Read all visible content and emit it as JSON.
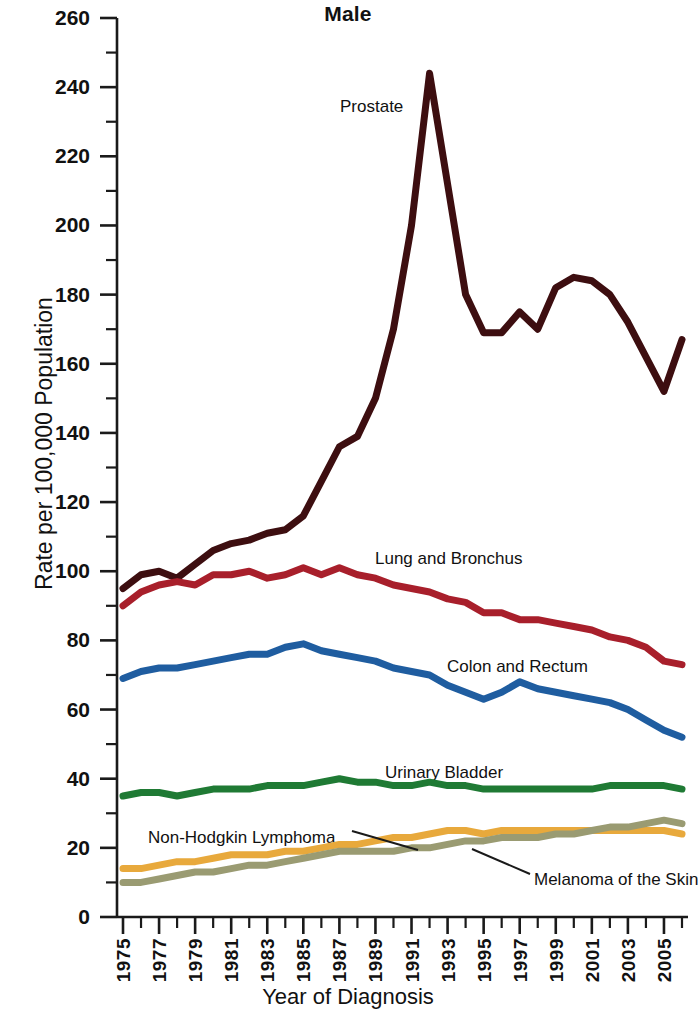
{
  "chart_data": {
    "type": "line",
    "title": "Male",
    "subtitle": "",
    "xlabel": "Year of Diagnosis",
    "ylabel": "Rate per 100,000 Population",
    "xlim": [
      1975,
      2006
    ],
    "ylim": [
      0,
      260
    ],
    "y_major_step": 20,
    "y_minor_step": 10,
    "grid": false,
    "legend_position": "inline-annotations",
    "y_tick_labels": [
      "0",
      "20",
      "40",
      "60",
      "80",
      "100",
      "120",
      "140",
      "160",
      "180",
      "200",
      "220",
      "240",
      "260"
    ],
    "x_tick_labels": [
      "1975",
      "1977",
      "1979",
      "1981",
      "1983",
      "1985",
      "1987",
      "1989",
      "1991",
      "1993",
      "1995",
      "1997",
      "1999",
      "2001",
      "2003",
      "2005"
    ],
    "x": [
      1975,
      1976,
      1977,
      1978,
      1979,
      1980,
      1981,
      1982,
      1983,
      1984,
      1985,
      1986,
      1987,
      1988,
      1989,
      1990,
      1991,
      1992,
      1993,
      1994,
      1995,
      1996,
      1997,
      1998,
      1999,
      2000,
      2001,
      2002,
      2003,
      2004,
      2005,
      2006
    ],
    "series": [
      {
        "name": "Prostate",
        "color": "#3D0E10",
        "label_x": 340,
        "label_y": 97,
        "leader": false,
        "values": [
          95,
          99,
          100,
          98,
          102,
          106,
          108,
          109,
          111,
          112,
          116,
          126,
          136,
          139,
          150,
          170,
          200,
          244,
          212,
          180,
          169,
          169,
          175,
          170,
          182,
          185,
          184,
          180,
          172,
          162,
          152,
          167
        ]
      },
      {
        "name": "Lung and Bronchus",
        "color": "#A81F2B",
        "label_x": 375,
        "label_y": 549,
        "leader": false,
        "values": [
          90,
          94,
          96,
          97,
          96,
          99,
          99,
          100,
          98,
          99,
          101,
          99,
          101,
          99,
          98,
          96,
          95,
          94,
          92,
          91,
          88,
          88,
          86,
          86,
          85,
          84,
          83,
          81,
          80,
          78,
          74,
          73
        ]
      },
      {
        "name": "Colon and Rectum",
        "color": "#1F5DA0",
        "label_x": 447,
        "label_y": 657,
        "leader": false,
        "values": [
          69,
          71,
          72,
          72,
          73,
          74,
          75,
          76,
          76,
          78,
          79,
          77,
          76,
          75,
          74,
          72,
          71,
          70,
          67,
          65,
          63,
          65,
          68,
          66,
          65,
          64,
          63,
          62,
          60,
          57,
          54,
          52
        ]
      },
      {
        "name": "Urinary Bladder",
        "color": "#1F7A34",
        "label_x": 385,
        "label_y": 763,
        "leader": false,
        "values": [
          35,
          36,
          36,
          35,
          36,
          37,
          37,
          37,
          38,
          38,
          38,
          39,
          40,
          39,
          39,
          38,
          38,
          39,
          38,
          38,
          37,
          37,
          37,
          37,
          37,
          37,
          37,
          38,
          38,
          38,
          38,
          37
        ]
      },
      {
        "name": "Non-Hodgkin Lymphoma",
        "color": "#E8A93C",
        "label_x": 148,
        "label_y": 828,
        "leader": true,
        "leader_path": "M 352 831 L 418 850",
        "values": [
          14,
          14,
          15,
          16,
          16,
          17,
          18,
          18,
          18,
          19,
          19,
          20,
          21,
          21,
          22,
          23,
          23,
          24,
          25,
          25,
          24,
          25,
          25,
          25,
          25,
          25,
          25,
          25,
          25,
          25,
          25,
          24
        ]
      },
      {
        "name": "Melanoma of the Skin",
        "color": "#9A9B72",
        "label_x": 534,
        "label_y": 870,
        "leader": true,
        "leader_path": "M 530 874 L 472 849",
        "values": [
          10,
          10,
          11,
          12,
          13,
          13,
          14,
          15,
          15,
          16,
          17,
          18,
          19,
          19,
          19,
          19,
          20,
          20,
          21,
          22,
          22,
          23,
          23,
          23,
          24,
          24,
          25,
          26,
          26,
          27,
          28,
          27
        ]
      }
    ]
  },
  "axes": {
    "y_axis_name": "rate-axis",
    "x_axis_name": "year-axis"
  }
}
